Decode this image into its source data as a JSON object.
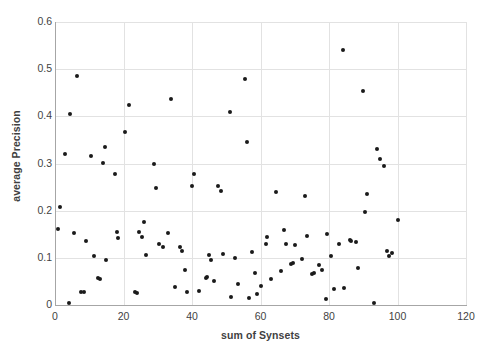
{
  "chart_data": {
    "type": "scatter",
    "title": "",
    "xlabel": "sum of Synsets",
    "ylabel": "average Precision",
    "xlim": [
      0,
      120
    ],
    "ylim": [
      0,
      0.6
    ],
    "xticks": [
      0,
      20,
      40,
      60,
      80,
      100,
      120
    ],
    "yticks": [
      0,
      0.1,
      0.2,
      0.3,
      0.4,
      0.5,
      0.6
    ],
    "xtick_labels": [
      "0",
      "20",
      "40",
      "60",
      "80",
      "100",
      "120"
    ],
    "ytick_labels": [
      "0",
      "0.1",
      "0.2",
      "0.3",
      "0.4",
      "0.5",
      "0.6"
    ],
    "grid": true,
    "grid_color": "#e2e2e2",
    "marker_color": "#1a1a1a",
    "marker_size": 4,
    "legend": null,
    "series": [
      {
        "name": "average Precision vs sum of Synsets",
        "points": [
          [
            1.0,
            0.161
          ],
          [
            1.5,
            0.208
          ],
          [
            3.0,
            0.321
          ],
          [
            4.0,
            0.005
          ],
          [
            4.5,
            0.404
          ],
          [
            5.5,
            0.152
          ],
          [
            6.5,
            0.485
          ],
          [
            7.5,
            0.028
          ],
          [
            8.5,
            0.028
          ],
          [
            9.0,
            0.136
          ],
          [
            10.5,
            0.315
          ],
          [
            11.5,
            0.104
          ],
          [
            12.5,
            0.058
          ],
          [
            13.0,
            0.056
          ],
          [
            14.0,
            0.301
          ],
          [
            14.5,
            0.334
          ],
          [
            15.0,
            0.096
          ],
          [
            17.5,
            0.278
          ],
          [
            18.0,
            0.155
          ],
          [
            18.5,
            0.143
          ],
          [
            20.5,
            0.366
          ],
          [
            21.5,
            0.424
          ],
          [
            23.5,
            0.028
          ],
          [
            24.0,
            0.025
          ],
          [
            24.5,
            0.154
          ],
          [
            25.5,
            0.145
          ],
          [
            26.0,
            0.177
          ],
          [
            26.5,
            0.106
          ],
          [
            29.0,
            0.299
          ],
          [
            29.5,
            0.249
          ],
          [
            30.5,
            0.13
          ],
          [
            31.5,
            0.122
          ],
          [
            33.0,
            0.153
          ],
          [
            34.0,
            0.437
          ],
          [
            35.0,
            0.039
          ],
          [
            36.5,
            0.122
          ],
          [
            37.0,
            0.114
          ],
          [
            38.0,
            0.074
          ],
          [
            38.5,
            0.028
          ],
          [
            40.0,
            0.252
          ],
          [
            40.5,
            0.278
          ],
          [
            42.0,
            0.03
          ],
          [
            44.0,
            0.057
          ],
          [
            44.5,
            0.06
          ],
          [
            45.0,
            0.106
          ],
          [
            45.5,
            0.095
          ],
          [
            46.5,
            0.051
          ],
          [
            47.5,
            0.253
          ],
          [
            48.5,
            0.241
          ],
          [
            49.0,
            0.108
          ],
          [
            51.0,
            0.41
          ],
          [
            51.5,
            0.016
          ],
          [
            52.5,
            0.099
          ],
          [
            53.5,
            0.045
          ],
          [
            55.5,
            0.48
          ],
          [
            56.0,
            0.345
          ],
          [
            56.5,
            0.014
          ],
          [
            57.5,
            0.112
          ],
          [
            58.5,
            0.068
          ],
          [
            59.0,
            0.023
          ],
          [
            60.0,
            0.041
          ],
          [
            61.5,
            0.13
          ],
          [
            62.0,
            0.145
          ],
          [
            63.0,
            0.056
          ],
          [
            64.5,
            0.239
          ],
          [
            66.0,
            0.072
          ],
          [
            67.0,
            0.158
          ],
          [
            67.5,
            0.13
          ],
          [
            69.0,
            0.086
          ],
          [
            69.5,
            0.09
          ],
          [
            70.0,
            0.127
          ],
          [
            72.0,
            0.097
          ],
          [
            73.0,
            0.232
          ],
          [
            73.5,
            0.146
          ],
          [
            75.0,
            0.065
          ],
          [
            75.5,
            0.068
          ],
          [
            77.0,
            0.085
          ],
          [
            78.0,
            0.075
          ],
          [
            79.0,
            0.012
          ],
          [
            79.5,
            0.151
          ],
          [
            80.5,
            0.104
          ],
          [
            81.5,
            0.034
          ],
          [
            83.0,
            0.13
          ],
          [
            84.0,
            0.541
          ],
          [
            84.5,
            0.035
          ],
          [
            86.0,
            0.138
          ],
          [
            86.5,
            0.135
          ],
          [
            88.0,
            0.134
          ],
          [
            88.5,
            0.079
          ],
          [
            90.0,
            0.453
          ],
          [
            90.5,
            0.197
          ],
          [
            91.0,
            0.235
          ],
          [
            93.0,
            0.005
          ],
          [
            94.0,
            0.331
          ],
          [
            95.0,
            0.309
          ],
          [
            96.0,
            0.294
          ],
          [
            97.0,
            0.114
          ],
          [
            97.5,
            0.104
          ],
          [
            98.5,
            0.111
          ],
          [
            100.0,
            0.18
          ]
        ]
      }
    ]
  }
}
